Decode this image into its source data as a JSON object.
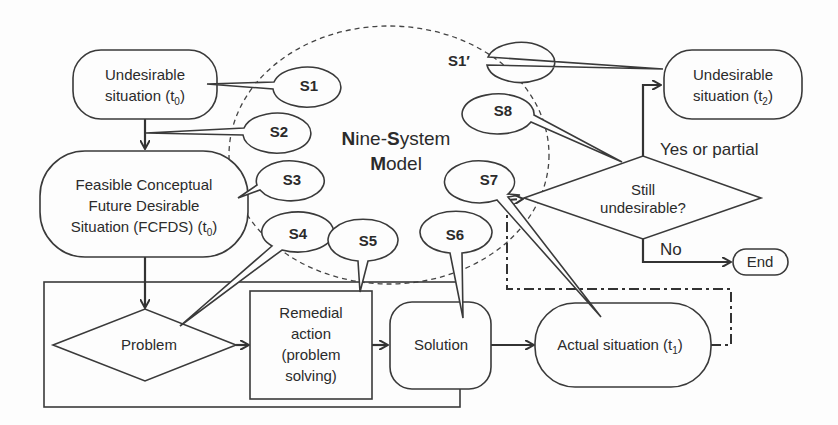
{
  "title": {
    "line1_parts": [
      {
        "text": "N",
        "bold": true
      },
      {
        "text": "ine-",
        "bold": false
      },
      {
        "text": "S",
        "bold": true
      },
      {
        "text": "ystem",
        "bold": false
      }
    ],
    "line2_parts": [
      {
        "text": "M",
        "bold": true
      },
      {
        "text": "odel",
        "bold": false
      }
    ],
    "full": "Nine-System Model"
  },
  "nodes": {
    "undesirable_t0": {
      "line1": "Undesirable",
      "line2": "situation (t",
      "sub": "0",
      "close": ")"
    },
    "fcfds": {
      "line1": "Feasible Conceptual",
      "line2": "Future Desirable",
      "line3": "Situation (FCFDS) (t",
      "sub": "0",
      "close": ")"
    },
    "problem": {
      "label": "Problem"
    },
    "remedial": {
      "line1": "Remedial",
      "line2": "action",
      "line3": "(problem",
      "line4": "solving)"
    },
    "solution": {
      "label": "Solution"
    },
    "actual": {
      "label": "Actual situation (t",
      "sub": "1",
      "close": ")"
    },
    "still_undesirable": {
      "line1": "Still",
      "line2": "undesirable?"
    },
    "undesirable_t2": {
      "line1": "Undesirable",
      "line2": "situation (t",
      "sub": "2",
      "close": ")"
    },
    "end": {
      "label": "End"
    }
  },
  "edge_labels": {
    "yes": "Yes or partial",
    "no": "No"
  },
  "bubbles": [
    {
      "id": "S1",
      "label": "S1"
    },
    {
      "id": "S2",
      "label": "S2"
    },
    {
      "id": "S3",
      "label": "S3"
    },
    {
      "id": "S4",
      "label": "S4"
    },
    {
      "id": "S5",
      "label": "S5"
    },
    {
      "id": "S6",
      "label": "S6"
    },
    {
      "id": "S7",
      "label": "S7"
    },
    {
      "id": "S8",
      "label": "S8"
    },
    {
      "id": "S1p",
      "label": "S1′"
    }
  ],
  "colors": {
    "line": "#3a3a3a",
    "background": "#fdfdfd",
    "text": "#2b2b2b"
  }
}
